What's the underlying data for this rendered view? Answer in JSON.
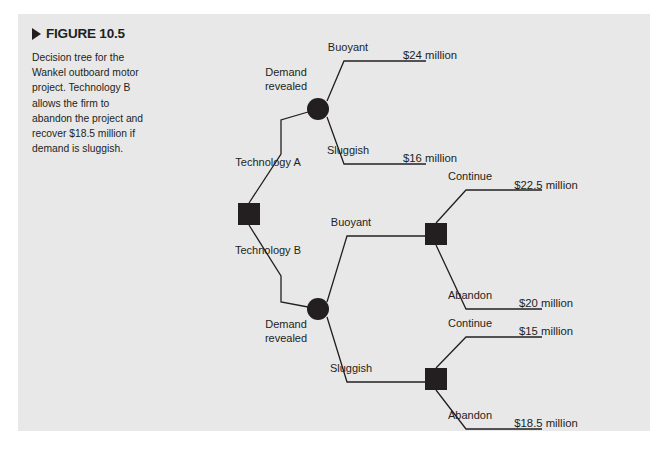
{
  "figure": {
    "marker_icon": "triangle-right-icon",
    "label": "FIGURE 10.5",
    "caption": "Decision tree for the Wankel outboard motor project. Technology B allows the firm to abandon the project and recover $18.5 million if demand is sluggish.",
    "panel_background": "#e8e8e8",
    "ink_color": "#231f20"
  },
  "chart_data": {
    "type": "diagram",
    "diagram_kind": "decision-tree",
    "title": "Decision tree for the Wankel outboard motor project",
    "nodes": [
      {
        "id": "root",
        "kind": "decision",
        "shape": "square",
        "x": 231,
        "y": 200,
        "label": ""
      },
      {
        "id": "techA_chance",
        "kind": "chance",
        "shape": "circle",
        "x": 300,
        "y": 95,
        "label": "Demand\nrevealed",
        "label_line1": "Demand",
        "label_line2": "revealed",
        "label_x": 268,
        "label_y1": 62,
        "label_y2": 76,
        "label_anchor": "middle"
      },
      {
        "id": "techB_chance",
        "kind": "chance",
        "shape": "circle",
        "x": 300,
        "y": 295,
        "label": "Demand\nrevealed",
        "label_line1": "Demand",
        "label_line2": "revealed",
        "label_x": 268,
        "label_y1": 314,
        "label_y2": 328,
        "label_anchor": "middle"
      },
      {
        "id": "buoyant_decision",
        "kind": "decision",
        "shape": "square",
        "x": 418,
        "y": 220,
        "label": ""
      },
      {
        "id": "sluggish_decision",
        "kind": "decision",
        "shape": "square",
        "x": 418,
        "y": 365,
        "label": ""
      }
    ],
    "branches": [
      {
        "id": "technology-a",
        "label": "Technology A",
        "label_x": 250,
        "label_y": 152,
        "from": "root",
        "to": "techA_chance"
      },
      {
        "id": "technology-b",
        "label": "Technology B",
        "label_x": 250,
        "label_y": 240,
        "from": "root",
        "to": "techB_chance"
      },
      {
        "id": "a-buoyant",
        "label": "Buoyant",
        "label_x": 330,
        "label_y": 37,
        "from": "techA_chance",
        "to": "payoff-24"
      },
      {
        "id": "a-sluggish",
        "label": "Sluggish",
        "label_x": 330,
        "label_y": 140,
        "from": "techA_chance",
        "to": "payoff-16"
      },
      {
        "id": "b-buoyant",
        "label": "Buoyant",
        "label_x": 333,
        "label_y": 212,
        "from": "techB_chance",
        "to": "buoyant_decision"
      },
      {
        "id": "b-sluggish",
        "label": "Sluggish",
        "label_x": 333,
        "label_y": 358,
        "from": "techB_chance",
        "to": "sluggish_decision"
      },
      {
        "id": "buoyant-continue",
        "label": "Continue",
        "label_x": 452,
        "label_y": 166,
        "from": "buoyant_decision",
        "to": "payoff-22-5"
      },
      {
        "id": "buoyant-abandon",
        "label": "Abandon",
        "label_x": 452,
        "label_y": 285,
        "from": "buoyant_decision",
        "to": "payoff-20"
      },
      {
        "id": "sluggish-continue",
        "label": "Continue",
        "label_x": 452,
        "label_y": 313,
        "from": "sluggish_decision",
        "to": "payoff-15"
      },
      {
        "id": "sluggish-abandon",
        "label": "Abandon",
        "label_x": 452,
        "label_y": 405,
        "from": "sluggish_decision",
        "to": "payoff-18-5"
      }
    ],
    "payoffs": [
      {
        "id": "payoff-24",
        "text": "$24 million",
        "x": 412,
        "y": 45,
        "branch": "a-buoyant"
      },
      {
        "id": "payoff-16",
        "text": "$16 million",
        "x": 412,
        "y": 148,
        "branch": "a-sluggish"
      },
      {
        "id": "payoff-22-5",
        "text": "$22.5 million",
        "x": 528,
        "y": 175,
        "branch": "buoyant-continue"
      },
      {
        "id": "payoff-20",
        "text": "$20 million",
        "x": 528,
        "y": 293,
        "branch": "buoyant-abandon"
      },
      {
        "id": "payoff-15",
        "text": "$15 million",
        "x": 528,
        "y": 321,
        "branch": "sluggish-continue"
      },
      {
        "id": "payoff-18-5",
        "text": "$18.5 million",
        "x": 528,
        "y": 413,
        "branch": "sluggish-abandon"
      }
    ],
    "edges": [
      {
        "id": "edge-technology-a",
        "points": "231,189 263,140 263,106 290,98"
      },
      {
        "id": "edge-technology-b",
        "points": "231,211 263,262 263,288 290,293"
      },
      {
        "id": "edge-a-buoyant",
        "points": "309,87 326,47 408,47"
      },
      {
        "id": "edge-a-sluggish",
        "points": "309,103 326,150 408,150"
      },
      {
        "id": "edge-b-buoyant",
        "points": "309,288 329,222 407,222"
      },
      {
        "id": "edge-b-sluggish",
        "points": "309,303 329,368 407,368"
      },
      {
        "id": "edge-buoyant-continue",
        "points": "418,209 448,176 524,176"
      },
      {
        "id": "edge-buoyant-abandon",
        "points": "418,231 448,295 524,295"
      },
      {
        "id": "edge-sluggish-continue",
        "points": "418,354 448,323 524,323"
      },
      {
        "id": "edge-sluggish-abandon",
        "points": "418,376 448,415 524,415"
      }
    ]
  }
}
